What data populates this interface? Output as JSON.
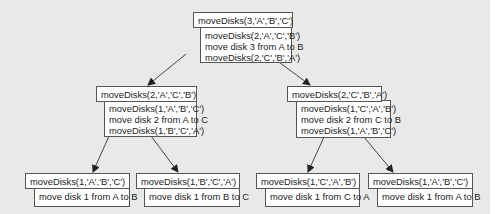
{
  "diagram": {
    "type": "recursion-tree",
    "nodes": [
      {
        "id": "root",
        "call": "moveDisks(3,'A','B','C')",
        "steps": [
          "moveDisks(2,'A','C','B')",
          "move disk 3 from A to B",
          "moveDisks(2,'C','B','A')"
        ]
      },
      {
        "id": "mid-left",
        "call": "moveDisks(2,'A','C','B')",
        "steps": [
          "moveDisks(1,'A','B','C')",
          "move disk 2 from A to C",
          "moveDisks(1,'B','C','A')"
        ]
      },
      {
        "id": "mid-right",
        "call": "moveDisks(2,'C','B','A')",
        "steps": [
          "moveDisks(1,'C','A','B')",
          "move disk 2 from C to B",
          "moveDisks(1,'A','B','C')"
        ]
      },
      {
        "id": "leaf-1",
        "call": "moveDisks(1,'A','B','C')",
        "steps": [
          "move disk 1 from A to B"
        ]
      },
      {
        "id": "leaf-2",
        "call": "moveDisks(1,'B','C','A')",
        "steps": [
          "move disk 1 from B to C"
        ]
      },
      {
        "id": "leaf-3",
        "call": "moveDisks(1,'C','A','B')",
        "steps": [
          "move disk 1 from C to A"
        ]
      },
      {
        "id": "leaf-4",
        "call": "moveDisks(1,'A','B','C')",
        "steps": [
          "move disk 1 from A to B"
        ]
      }
    ],
    "edges": [
      {
        "from": "root",
        "to": "mid-left"
      },
      {
        "from": "root",
        "to": "mid-right"
      },
      {
        "from": "mid-left",
        "to": "leaf-1"
      },
      {
        "from": "mid-left",
        "to": "leaf-2"
      },
      {
        "from": "mid-right",
        "to": "leaf-3"
      },
      {
        "from": "mid-right",
        "to": "leaf-4"
      }
    ],
    "colors": {
      "background": "#e9e9e9",
      "box_fill": "#ffffff",
      "box_border": "#555555",
      "arrow": "#333333",
      "text": "#222222"
    }
  }
}
